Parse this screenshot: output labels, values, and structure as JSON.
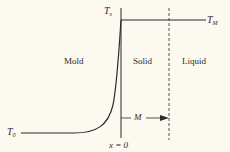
{
  "diagram": {
    "type": "temperature-profile",
    "regions": {
      "mold": "Mold",
      "solid": "Solid",
      "liquid": "Liquid"
    },
    "labels": {
      "t_s": {
        "base": "T",
        "sub": "s"
      },
      "t_m": {
        "base": "T",
        "sub": "M"
      },
      "t_0": {
        "base": "T",
        "sub": "0"
      },
      "x_origin": "x = 0",
      "thickness": "M"
    },
    "colors": {
      "background": "#fbf9f0",
      "line": "#2a2a2a",
      "dashed": "#555555"
    }
  }
}
